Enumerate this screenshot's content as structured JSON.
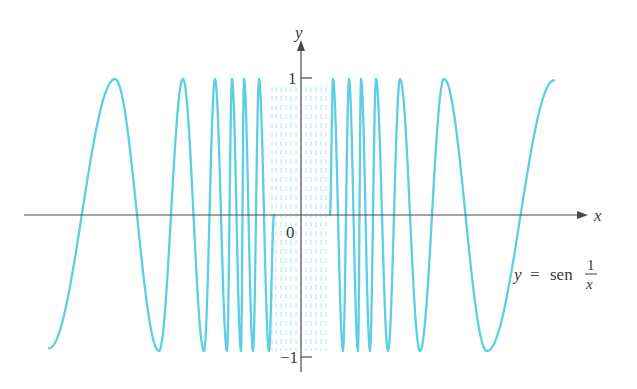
{
  "chart_data": {
    "type": "line",
    "title": "",
    "function": "y = sen(1/x)",
    "xlabel": "x",
    "ylabel": "y",
    "ylim": [
      -1,
      1
    ],
    "grid": false,
    "legend": null,
    "annotations": [
      {
        "text": "y = sen 1/x",
        "position": "right, below x-axis"
      }
    ],
    "y_ticks": [
      {
        "value": 1,
        "label": "1"
      },
      {
        "value": -1,
        "label": "−1"
      }
    ],
    "origin_label": "0",
    "series": [
      {
        "name": "y = sen(1/x)",
        "color": "#5ccfe6",
        "extrema_px_left": [
          {
            "x": 49,
            "y": -0.98
          },
          {
            "x": 115,
            "y": 1
          },
          {
            "x": 159,
            "y": -1
          },
          {
            "x": 183,
            "y": 1
          },
          {
            "x": 204,
            "y": -1
          },
          {
            "x": 215,
            "y": 1
          },
          {
            "x": 227,
            "y": -1
          },
          {
            "x": 232,
            "y": 1
          },
          {
            "x": 241,
            "y": -1
          },
          {
            "x": 244,
            "y": 1
          },
          {
            "x": 253,
            "y": -1
          },
          {
            "x": 259,
            "y": 1
          },
          {
            "x": 269,
            "y": -1
          },
          {
            "x": 274,
            "y": 0
          }
        ],
        "extrema_px_right": [
          {
            "x": 330,
            "y": 0
          },
          {
            "x": 333,
            "y": 1
          },
          {
            "x": 343,
            "y": -1
          },
          {
            "x": 349,
            "y": 1
          },
          {
            "x": 358,
            "y": -1
          },
          {
            "x": 361,
            "y": 1
          },
          {
            "x": 370,
            "y": -1
          },
          {
            "x": 376,
            "y": 1
          },
          {
            "x": 388,
            "y": -1
          },
          {
            "x": 400,
            "y": 1
          },
          {
            "x": 420,
            "y": -1
          },
          {
            "x": 444,
            "y": 1
          },
          {
            "x": 487,
            "y": -1
          },
          {
            "x": 554,
            "y": 0.99
          }
        ]
      }
    ],
    "axes_px": {
      "origin_x": 301,
      "axis_y": 215,
      "y_plus1": 83,
      "y_minus1": 355,
      "x_axis_start": 24,
      "x_axis_end": 588,
      "y_axis_top": 40,
      "y_axis_bottom": 372
    },
    "dashed_region_px": [
      272,
      276,
      281,
      286,
      291,
      296,
      306,
      311,
      316,
      321,
      326
    ]
  },
  "labels": {
    "x_axis": "x",
    "y_axis": "y",
    "tick_pos": "1",
    "tick_neg": "−1",
    "origin": "0",
    "func_lhs": "y",
    "func_eq": "=",
    "func_name": "sen",
    "frac_num": "1",
    "frac_den": "x"
  },
  "colors": {
    "curve": "#5ccfe6",
    "curve_faint": "#bfe9f3",
    "axis": "#4a4a4a",
    "text": "#3a3a3a",
    "background": "#ffffff"
  }
}
